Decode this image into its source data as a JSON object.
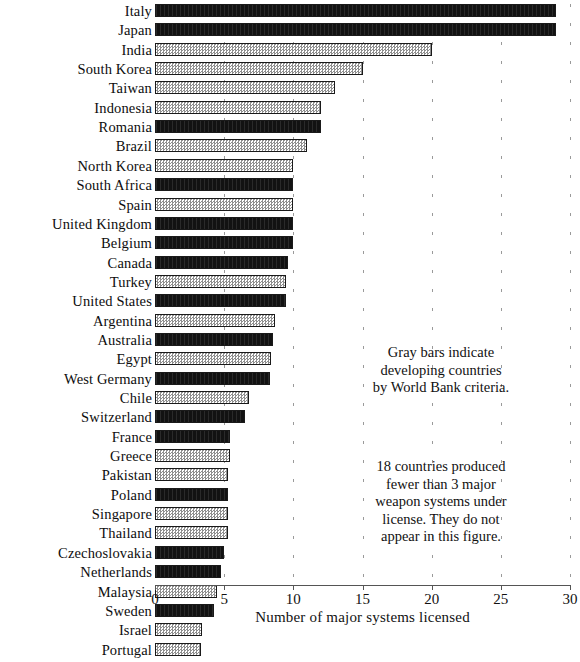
{
  "chart_data": {
    "type": "bar",
    "orientation": "horizontal",
    "title": "",
    "xlabel": "Number of major systems licensed",
    "ylabel": "",
    "xlim": [
      0,
      30
    ],
    "xticks": [
      0,
      5,
      10,
      15,
      20,
      25,
      30
    ],
    "xtick_labels": [
      "0",
      "5",
      "10",
      "15",
      "20",
      "25",
      "30"
    ],
    "grid": true,
    "legend_position": "none",
    "series_encoding": {
      "dark": "industrialized country",
      "gray": "developing country (World Bank criteria)"
    },
    "categories": [
      "Italy",
      "Japan",
      "India",
      "South Korea",
      "Taiwan",
      "Indonesia",
      "Romania",
      "Brazil",
      "North Korea",
      "South Africa",
      "Spain",
      "United Kingdom",
      "Belgium",
      "Canada",
      "Turkey",
      "United States",
      "Argentina",
      "Australia",
      "Egypt",
      "West Germany",
      "Chile",
      "Switzerland",
      "France",
      "Greece",
      "Pakistan",
      "Poland",
      "Singapore",
      "Thailand",
      "Czechoslovakia",
      "Netherlands",
      "Malaysia",
      "Sweden",
      "Israel",
      "Portugal"
    ],
    "values": [
      29,
      29,
      20,
      15,
      13,
      12,
      12,
      11,
      10,
      10,
      10,
      10,
      10,
      9.6,
      9.5,
      9.5,
      8.7,
      8.5,
      8.4,
      8.3,
      6.8,
      6.5,
      5.4,
      5.4,
      5.3,
      5.3,
      5.3,
      5.3,
      5,
      4.8,
      4.5,
      4.3,
      3.4,
      3.3
    ],
    "bar_fill": [
      "dark",
      "dark",
      "gray",
      "gray",
      "gray",
      "gray",
      "dark",
      "gray",
      "gray",
      "dark",
      "gray",
      "dark",
      "dark",
      "dark",
      "gray",
      "dark",
      "gray",
      "dark",
      "gray",
      "dark",
      "gray",
      "dark",
      "dark",
      "gray",
      "gray",
      "dark",
      "gray",
      "gray",
      "dark",
      "dark",
      "gray",
      "dark",
      "gray",
      "gray"
    ],
    "annotations": [
      {
        "id": "legend-note",
        "lines": [
          "Gray bars indicate",
          "developing countries",
          "by World Bank criteria."
        ]
      },
      {
        "id": "excluded-note",
        "lines": [
          "18 countries produced",
          "fewer than 3 major",
          "weapon systems under",
          "license. They do not",
          "appear in this figure."
        ]
      }
    ],
    "colors": {
      "dark_bar": "#121212",
      "gray_bar": "#8f8f8f",
      "axis": "#555555",
      "text": "#111111",
      "background": "#ffffff"
    }
  }
}
